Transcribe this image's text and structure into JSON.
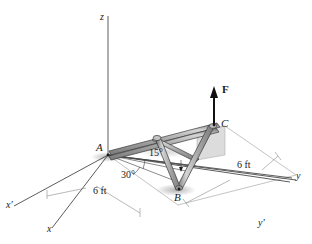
{
  "figure": {
    "background_color": "#ffffff",
    "line_color": "#1a1a1a",
    "axis_color": "#555555",
    "member_fill": "#b8b8b8",
    "member_edge": "#3a3a3a",
    "plane_fill": "#d8d8d8",
    "shadow_fill": "#cccccc"
  },
  "axes": [
    {
      "name": "z-axis",
      "label": "z",
      "position": "top"
    },
    {
      "name": "y-axis",
      "label": "y",
      "position": "right"
    },
    {
      "name": "y-prime-axis",
      "label": "y'",
      "position": "lower-right"
    },
    {
      "name": "x-axis",
      "label": "x",
      "position": "bottom-left"
    },
    {
      "name": "x-prime-axis",
      "label": "x'",
      "position": "left"
    }
  ],
  "points": [
    {
      "name": "point-A",
      "label": "A"
    },
    {
      "name": "point-B",
      "label": "B"
    },
    {
      "name": "point-C",
      "label": "C"
    }
  ],
  "force": {
    "label": "F",
    "direction": "up"
  },
  "angles": [
    {
      "name": "angle-15",
      "label": "15°"
    },
    {
      "name": "angle-30",
      "label": "30°"
    }
  ],
  "dimensions": [
    {
      "name": "dimension-left",
      "label": "6 ft"
    },
    {
      "name": "dimension-right",
      "label": "6 ft"
    }
  ]
}
